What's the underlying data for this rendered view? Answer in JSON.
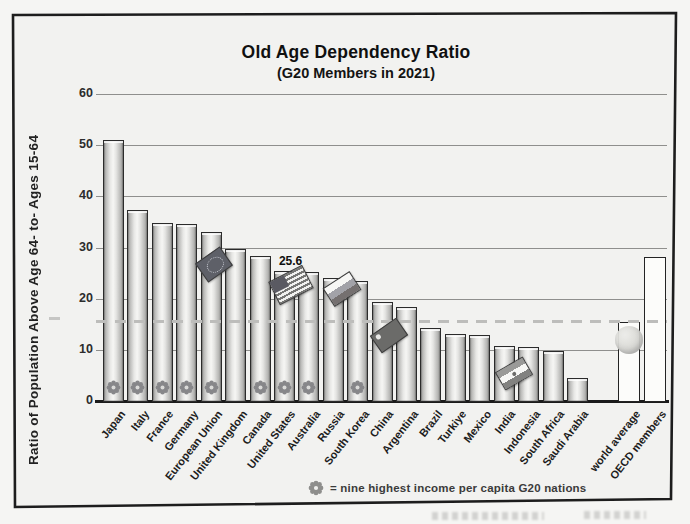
{
  "title": "Old Age Dependency Ratio",
  "subtitle": "(G20 Members in 2021)",
  "y_axis_label": "Ratio of Population Above Age 64- to- Ages 15-64",
  "legend": {
    "symbol": "star-rosette-icon",
    "text": "= nine highest income per capita G20 nations"
  },
  "annotation": {
    "target": "United States",
    "text": "25.6"
  },
  "colors": {
    "background": "#f3f3f1",
    "bar_fill_light": "#f6f6f4",
    "bar_fill_dark": "#8d8d8b",
    "bar_outline": "#2b2b2b",
    "summary_bar_fill": "#fcfcfa",
    "gridline": "#8f8f8d",
    "dashed_reference": "#bdbdbb",
    "text": "#141414"
  },
  "chart_data": {
    "type": "bar",
    "title": "Old Age Dependency Ratio",
    "subtitle": "(G20 Members in 2021)",
    "xlabel": "",
    "ylabel": "Ratio of Population Above Age 64- to- Ages 15-64",
    "ylim": [
      0,
      60
    ],
    "yticks": [
      0,
      10,
      20,
      30,
      40,
      50,
      60
    ],
    "grid": "horizontal",
    "legend_position": "bottom",
    "reference_line": {
      "value": 15.7,
      "style": "dashed"
    },
    "annotations": [
      {
        "target": "United States",
        "text": "25.6"
      }
    ],
    "categories": [
      "Japan",
      "Italy",
      "France",
      "Germany",
      "European Union",
      "United Kingdom",
      "Canada",
      "United States",
      "Australia",
      "Russia",
      "South Korea",
      "China",
      "Argentina",
      "Brazil",
      "Turkiye",
      "Mexico",
      "India",
      "Indonesia",
      "South Africa",
      "Saudi Arabia",
      "world average",
      "OECD members"
    ],
    "values": [
      51.3,
      37.5,
      35.0,
      34.8,
      33.2,
      30.0,
      28.5,
      25.6,
      25.5,
      24.2,
      23.6,
      19.6,
      18.5,
      14.4,
      13.3,
      13.0,
      11.0,
      10.8,
      9.9,
      4.6,
      15.7,
      28.3
    ],
    "bars": [
      {
        "label": "Japan",
        "value": 51.3,
        "star": true
      },
      {
        "label": "Italy",
        "value": 37.5,
        "star": true
      },
      {
        "label": "France",
        "value": 35.0,
        "star": true
      },
      {
        "label": "Germany",
        "value": 34.8,
        "star": true
      },
      {
        "label": "European Union",
        "value": 33.2,
        "star": true,
        "flag": "eu"
      },
      {
        "label": "United Kingdom",
        "value": 30.0
      },
      {
        "label": "Canada",
        "value": 28.5,
        "star": true
      },
      {
        "label": "United States",
        "value": 25.6,
        "star": true,
        "flag": "us",
        "callout": "25.6"
      },
      {
        "label": "Australia",
        "value": 25.5,
        "star": true
      },
      {
        "label": "Russia",
        "value": 24.2,
        "flag": "ru"
      },
      {
        "label": "South Korea",
        "value": 23.6,
        "star": true
      },
      {
        "label": "China",
        "value": 19.6,
        "flag": "cn"
      },
      {
        "label": "Argentina",
        "value": 18.5
      },
      {
        "label": "Brazil",
        "value": 14.4
      },
      {
        "label": "Turkiye",
        "value": 13.3
      },
      {
        "label": "Mexico",
        "value": 13.0
      },
      {
        "label": "India",
        "value": 11.0,
        "flag": "in"
      },
      {
        "label": "Indonesia",
        "value": 10.8
      },
      {
        "label": "South Africa",
        "value": 9.9
      },
      {
        "label": "Saudi Arabia",
        "value": 4.6
      },
      {
        "label": "world average",
        "value": 15.7,
        "summary": true,
        "globe": true
      },
      {
        "label": "OECD members",
        "value": 28.3,
        "summary": true
      }
    ]
  }
}
